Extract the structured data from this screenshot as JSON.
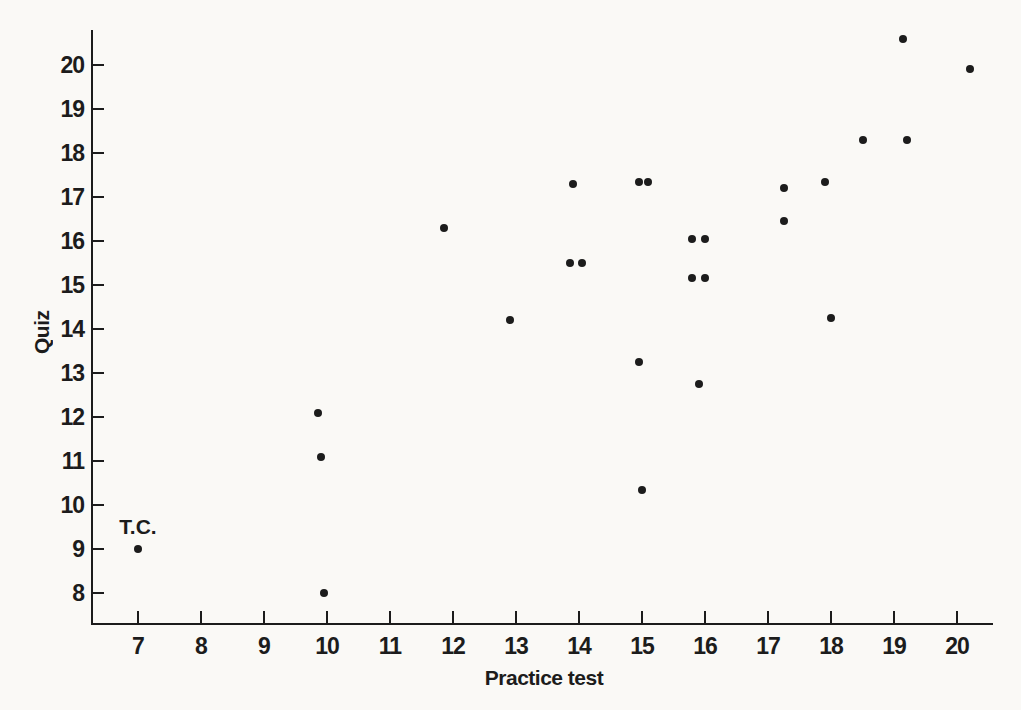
{
  "chart_data": {
    "type": "scatter",
    "title": "",
    "xlabel": "Practice test",
    "ylabel": "Quiz",
    "x_ticks": [
      7,
      8,
      9,
      10,
      11,
      12,
      13,
      14,
      15,
      16,
      17,
      18,
      19,
      20
    ],
    "y_ticks": [
      8,
      9,
      10,
      11,
      12,
      13,
      14,
      15,
      16,
      17,
      18,
      19,
      20
    ],
    "xlim": [
      6.3,
      20.6
    ],
    "ylim": [
      7.3,
      20.8
    ],
    "grid": false,
    "legend": null,
    "marker": {
      "shape": "filled-circle",
      "diameter_px": 8
    },
    "points": [
      [
        7.0,
        9.0
      ],
      [
        9.85,
        12.1
      ],
      [
        9.9,
        11.1
      ],
      [
        9.95,
        8.0
      ],
      [
        11.85,
        16.3
      ],
      [
        12.9,
        14.2
      ],
      [
        13.85,
        15.5
      ],
      [
        13.9,
        17.3
      ],
      [
        14.05,
        15.5
      ],
      [
        14.95,
        17.35
      ],
      [
        14.95,
        13.25
      ],
      [
        15.0,
        10.35
      ],
      [
        15.1,
        17.35
      ],
      [
        15.8,
        16.05
      ],
      [
        15.8,
        15.15
      ],
      [
        15.9,
        12.75
      ],
      [
        16.0,
        16.05
      ],
      [
        16.0,
        15.15
      ],
      [
        17.25,
        17.2
      ],
      [
        17.25,
        16.45
      ],
      [
        17.9,
        17.35
      ],
      [
        18.0,
        14.25
      ],
      [
        18.5,
        18.3
      ],
      [
        19.2,
        18.3
      ],
      [
        19.15,
        20.6
      ],
      [
        20.2,
        19.9
      ]
    ],
    "annotation": {
      "text": "T.C.",
      "x": 7.0,
      "y": 9.5
    }
  },
  "colors": {
    "background": "#faf9f6",
    "ink": "#1c1c1c"
  }
}
